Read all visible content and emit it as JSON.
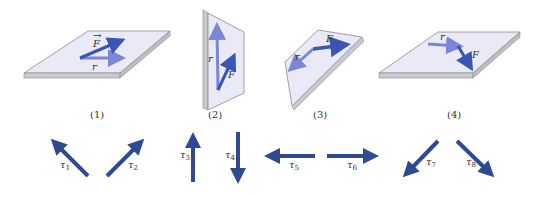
{
  "figure": {
    "colors": {
      "plate_top": "#e9eaf5",
      "plate_edge": "#c9cad0",
      "plate_stroke": "#8a8a90",
      "force_arrow": "#3a55b5",
      "position_arrow": "#7b86d9",
      "torque_arrow": "#2e4a93"
    },
    "panels": [
      {
        "id": "1",
        "caption": "(1)",
        "r_label": "r",
        "f_label": "F",
        "orientation": "horizontal plate"
      },
      {
        "id": "2",
        "caption": "(2)",
        "r_label": "r",
        "f_label": "F",
        "orientation": "vertical plate"
      },
      {
        "id": "3",
        "caption": "(3)",
        "r_label": "r",
        "f_label": "F",
        "orientation": "tilted plate"
      },
      {
        "id": "4",
        "caption": "(4)",
        "r_label": "r",
        "f_label": "F",
        "orientation": "horizontal plate"
      }
    ],
    "torques": [
      {
        "symbol": "τ",
        "index": "1",
        "direction": "up-left"
      },
      {
        "symbol": "τ",
        "index": "2",
        "direction": "up-right"
      },
      {
        "symbol": "τ",
        "index": "3",
        "direction": "up"
      },
      {
        "symbol": "τ",
        "index": "4",
        "direction": "down"
      },
      {
        "symbol": "τ",
        "index": "5",
        "direction": "left"
      },
      {
        "symbol": "τ",
        "index": "6",
        "direction": "right"
      },
      {
        "symbol": "τ",
        "index": "7",
        "direction": "down-left"
      },
      {
        "symbol": "τ",
        "index": "8",
        "direction": "down-right"
      }
    ]
  }
}
